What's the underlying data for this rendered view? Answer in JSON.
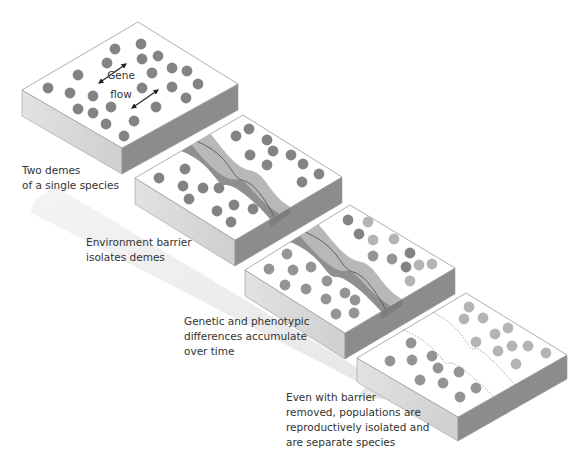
{
  "colors": {
    "top_face": "#ffffff",
    "left_face": "#d6d6d6",
    "right_face": "#8c8c8c",
    "edge": "#9a9a9a",
    "dot_dark": "#838383",
    "dot_mid": "#949494",
    "dot_light": "#b4b4b4",
    "river_light": "#b8b8b8",
    "river_dark": "#8f8f8f",
    "river_line": "#555555",
    "time_arrow": "#ececec"
  },
  "labels": {
    "gene": "Gene",
    "flow": "flow",
    "stage1": "Two demes\nof a single species",
    "stage2": "Environment barrier\nisolates demes",
    "stage3": "Genetic and phenotypic\ndifferences accumulate\nover time",
    "stage4": "Even with barrier\nremoved, populations are\nreproductively isolated and\nare separate species"
  },
  "blocks": [
    {
      "name": "stage-1-block",
      "top": [
        138,
        22
      ],
      "right": [
        238,
        84
      ],
      "front": [
        122,
        148
      ],
      "left": [
        22,
        90
      ],
      "depth": 26,
      "barrier": "none",
      "dots": [
        [
          115,
          49,
          "d"
        ],
        [
          141,
          44,
          "d"
        ],
        [
          107,
          63,
          "d"
        ],
        [
          142,
          59,
          "d"
        ],
        [
          158,
          56,
          "d"
        ],
        [
          78,
          75,
          "d"
        ],
        [
          172,
          68,
          "d"
        ],
        [
          187,
          71,
          "d"
        ],
        [
          152,
          73,
          "d"
        ],
        [
          48,
          88,
          "d"
        ],
        [
          70,
          93,
          "d"
        ],
        [
          93,
          96,
          "d"
        ],
        [
          142,
          88,
          "d"
        ],
        [
          172,
          87,
          "d"
        ],
        [
          198,
          84,
          "d"
        ],
        [
          186,
          98,
          "d"
        ],
        [
          78,
          109,
          "d"
        ],
        [
          93,
          113,
          "d"
        ],
        [
          111,
          107,
          "d"
        ],
        [
          156,
          107,
          "d"
        ],
        [
          106,
          124,
          "d"
        ],
        [
          134,
          121,
          "d"
        ],
        [
          124,
          136,
          "d"
        ]
      ]
    },
    {
      "name": "stage-2-block",
      "top": [
        243,
        115
      ],
      "right": [
        342,
        177
      ],
      "front": [
        235,
        240
      ],
      "left": [
        135,
        178
      ],
      "depth": 26,
      "barrier": "river",
      "dots": [
        [
          236,
          136,
          "d"
        ],
        [
          249,
          129,
          "d"
        ],
        [
          267,
          140,
          "d"
        ],
        [
          273,
          151,
          "d"
        ],
        [
          250,
          155,
          "d"
        ],
        [
          291,
          155,
          "d"
        ],
        [
          267,
          165,
          "d"
        ],
        [
          303,
          164,
          "d"
        ],
        [
          319,
          174,
          "d"
        ],
        [
          302,
          182,
          "d"
        ],
        [
          159,
          178,
          "d"
        ],
        [
          185,
          169,
          "d"
        ],
        [
          183,
          186,
          "d"
        ],
        [
          203,
          188,
          "d"
        ],
        [
          219,
          188,
          "d"
        ],
        [
          189,
          199,
          "d"
        ],
        [
          217,
          211,
          "d"
        ],
        [
          234,
          205,
          "d"
        ],
        [
          253,
          209,
          "d"
        ],
        [
          231,
          222,
          "d"
        ]
      ]
    },
    {
      "name": "stage-3-block",
      "top": [
        350,
        205
      ],
      "right": [
        455,
        268
      ],
      "front": [
        345,
        333
      ],
      "left": [
        245,
        270
      ],
      "depth": 26,
      "barrier": "river",
      "dots": [
        [
          348,
          220,
          "d"
        ],
        [
          368,
          222,
          "l"
        ],
        [
          359,
          234,
          "d"
        ],
        [
          373,
          240,
          "l"
        ],
        [
          394,
          239,
          "l"
        ],
        [
          373,
          256,
          "m"
        ],
        [
          392,
          259,
          "m"
        ],
        [
          410,
          253,
          "d"
        ],
        [
          406,
          267,
          "d"
        ],
        [
          419,
          265,
          "l"
        ],
        [
          432,
          264,
          "l"
        ],
        [
          410,
          281,
          "l"
        ],
        [
          287,
          254,
          "m"
        ],
        [
          269,
          269,
          "m"
        ],
        [
          293,
          270,
          "m"
        ],
        [
          311,
          267,
          "m"
        ],
        [
          285,
          285,
          "m"
        ],
        [
          306,
          289,
          "m"
        ],
        [
          327,
          281,
          "m"
        ],
        [
          326,
          299,
          "m"
        ],
        [
          345,
          293,
          "m"
        ],
        [
          355,
          300,
          "m"
        ],
        [
          336,
          314,
          "m"
        ],
        [
          354,
          313,
          "m"
        ]
      ]
    },
    {
      "name": "stage-4-block",
      "top": [
        466,
        293
      ],
      "right": [
        567,
        355
      ],
      "front": [
        458,
        417
      ],
      "left": [
        357,
        358
      ],
      "depth": 24,
      "barrier": "removed",
      "dots": [
        [
          469,
          307,
          "l"
        ],
        [
          464,
          319,
          "l"
        ],
        [
          483,
          318,
          "l"
        ],
        [
          508,
          328,
          "l"
        ],
        [
          495,
          334,
          "l"
        ],
        [
          476,
          342,
          "l"
        ],
        [
          512,
          346,
          "l"
        ],
        [
          528,
          346,
          "l"
        ],
        [
          498,
          351,
          "l"
        ],
        [
          546,
          353,
          "l"
        ],
        [
          516,
          364,
          "l"
        ],
        [
          411,
          343,
          "m"
        ],
        [
          390,
          361,
          "m"
        ],
        [
          412,
          360,
          "m"
        ],
        [
          432,
          356,
          "m"
        ],
        [
          438,
          368,
          "m"
        ],
        [
          459,
          372,
          "m"
        ],
        [
          420,
          380,
          "m"
        ],
        [
          443,
          383,
          "m"
        ],
        [
          476,
          388,
          "m"
        ],
        [
          460,
          397,
          "m"
        ]
      ]
    }
  ]
}
